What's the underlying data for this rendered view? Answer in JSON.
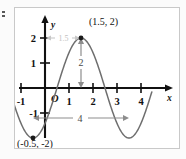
{
  "figure": {
    "edge_artifact_name": "edge-mark"
  },
  "chart_data": {
    "type": "line",
    "title": "",
    "subtitle": "",
    "xlabel": "x",
    "ylabel": "y",
    "xlim": [
      -1.45,
      4.45
    ],
    "ylim": [
      -2.55,
      2.45
    ],
    "grid": false,
    "legend": null,
    "function": "y = 2 sin( (pi/2)(x - 0.5) )",
    "amplitude": 2,
    "period": 4,
    "phase_shift": 1.5,
    "midline": 0,
    "x_ticks": [
      -1,
      1,
      2,
      3,
      4
    ],
    "x_tick_labels": [
      "-1",
      "1",
      "2",
      "3",
      "4"
    ],
    "y_ticks": [
      -1,
      1,
      2
    ],
    "y_tick_labels": [
      "-1",
      "1",
      "2"
    ],
    "origin_label": "O",
    "axis_labels": {
      "x": "x",
      "y": "y"
    },
    "points": [
      {
        "name": "maximum",
        "x": 1.5,
        "y": 2,
        "label": "(1.5, 2)"
      },
      {
        "name": "minimum",
        "x": -0.5,
        "y": -2,
        "label": "(-0.5, -2)"
      }
    ],
    "x": [
      -1.5,
      -1.25,
      -1,
      -0.75,
      -0.5,
      -0.25,
      0,
      0.25,
      0.5,
      0.75,
      1,
      1.25,
      1.5,
      1.75,
      2,
      2.25,
      2.5,
      2.75,
      3,
      3.25,
      3.5,
      3.75,
      4,
      4.25,
      4.5
    ],
    "y": [
      -1.41,
      -1.85,
      -2.0,
      -1.85,
      -2.0,
      -1.85,
      -1.41,
      -0.77,
      0.0,
      0.77,
      1.41,
      1.85,
      2.0,
      1.85,
      1.41,
      0.77,
      0.0,
      -0.77,
      -1.41,
      -1.85,
      -2.0,
      -1.85,
      -1.41,
      -0.77,
      0.0
    ],
    "annotations": [
      {
        "name": "amplitude-arrow",
        "label": "2",
        "orientation": "vertical",
        "from": [
          1.5,
          2
        ],
        "to": [
          1.5,
          0
        ]
      },
      {
        "name": "period-arrow",
        "label": "4",
        "orientation": "horizontal",
        "from": [
          -0.5,
          -0.55
        ],
        "to": [
          3.5,
          -0.55
        ]
      },
      {
        "name": "phase-shift-arrow",
        "label": "1.5",
        "orientation": "horizontal",
        "from": [
          0,
          2
        ],
        "to": [
          1.5,
          2
        ]
      }
    ]
  }
}
